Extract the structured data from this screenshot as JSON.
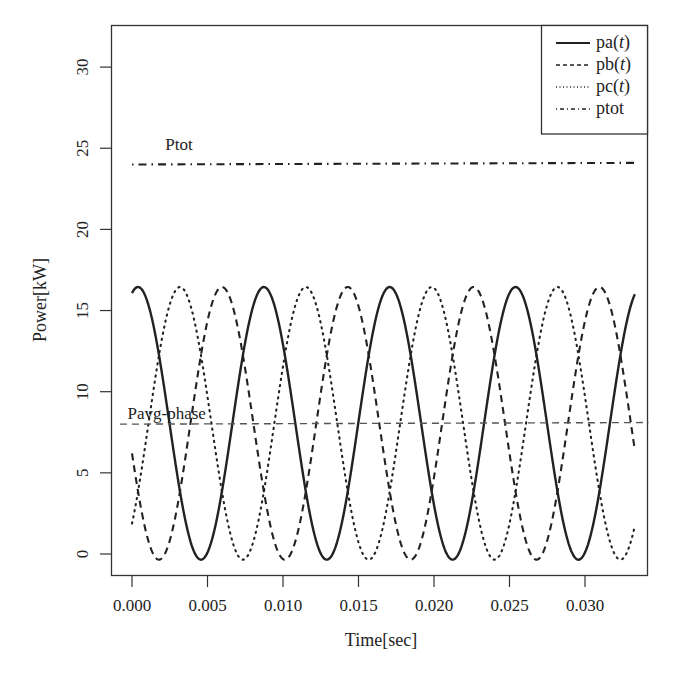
{
  "chart_data": {
    "type": "line",
    "title": "",
    "xlabel": "Time[sec]",
    "ylabel": "Power[kW]",
    "xlim": [
      -0.0013,
      0.0342
    ],
    "ylim": [
      -1.3,
      32.3
    ],
    "xticks": [
      0.0,
      0.005,
      0.01,
      0.015,
      0.02,
      0.025,
      0.03
    ],
    "xtick_labels": [
      "0.000",
      "0.005",
      "0.010",
      "0.015",
      "0.020",
      "0.025",
      "0.030"
    ],
    "yticks": [
      0,
      5,
      10,
      15,
      20,
      25,
      30
    ],
    "ytick_labels": [
      "0",
      "5",
      "10",
      "15",
      "20",
      "25",
      "30"
    ],
    "grid": false,
    "legend_position": "top-right",
    "legend": [
      {
        "label": "pa",
        "italic_arg": "t",
        "style": "solid"
      },
      {
        "label": "pb",
        "italic_arg": "t",
        "style": "dashed"
      },
      {
        "label": "pc",
        "italic_arg": "t",
        "style": "dotted"
      },
      {
        "label": "ptot",
        "italic_arg": "",
        "style": "dashdot"
      }
    ],
    "annotations": [
      {
        "text": "Ptot",
        "x": 0.0022,
        "y": 24.9
      },
      {
        "text": "Pavg-phase",
        "x": -0.0003,
        "y": 8.3
      }
    ],
    "model": {
      "description": "p_k(t) = Pavg + A*cos(2*pi*f*(t - t0 - k*T/3)), f = 120 Hz",
      "pavg": 8.05,
      "amplitude": 8.4,
      "frequency_hz": 120,
      "t0": 0.0004,
      "t_start": 0.0,
      "t_end": 0.0333
    },
    "series": [
      {
        "name": "pa(t)",
        "style": "solid",
        "x": [
          0.0,
          0.0004,
          0.0025,
          0.0046,
          0.0067,
          0.0088,
          0.0108,
          0.0129,
          0.015,
          0.0171,
          0.0192,
          0.0213,
          0.0233,
          0.0254,
          0.0275,
          0.0296,
          0.0317,
          0.0333
        ],
        "values": [
          16.1,
          16.4,
          8.0,
          -0.3,
          8.0,
          16.4,
          8.4,
          -0.3,
          7.7,
          16.4,
          8.4,
          -0.3,
          7.6,
          16.4,
          8.5,
          -0.3,
          7.6,
          16.2
        ]
      },
      {
        "name": "pb(t)",
        "style": "dashed",
        "x": [
          0.0,
          0.0018,
          0.0039,
          0.006,
          0.0081,
          0.0101,
          0.0122,
          0.0143,
          0.0164,
          0.0185,
          0.0206,
          0.0226,
          0.0247,
          0.0268,
          0.0289,
          0.031,
          0.0333
        ],
        "values": [
          6.5,
          -0.3,
          8.0,
          16.4,
          8.0,
          -0.3,
          8.0,
          16.4,
          8.0,
          -0.3,
          8.0,
          16.4,
          8.0,
          -0.3,
          8.0,
          16.4,
          6.6
        ]
      },
      {
        "name": "pc(t)",
        "style": "dotted",
        "x": [
          0.0,
          0.0011,
          0.0032,
          0.0053,
          0.0074,
          0.0094,
          0.0115,
          0.0136,
          0.0157,
          0.0178,
          0.0198,
          0.0219,
          0.024,
          0.0261,
          0.0282,
          0.0303,
          0.0324,
          0.0333
        ],
        "values": [
          1.5,
          8.0,
          16.4,
          8.0,
          -0.3,
          8.0,
          16.4,
          8.0,
          -0.3,
          8.0,
          16.4,
          8.0,
          -0.3,
          8.0,
          16.4,
          8.0,
          -0.3,
          1.3
        ]
      },
      {
        "name": "ptot",
        "style": "dashdot",
        "x": [
          0.0,
          0.0333
        ],
        "values": [
          24.0,
          24.1
        ]
      },
      {
        "name": "Pavg-phase",
        "style": "dashed",
        "x": [
          -0.0008,
          0.0342
        ],
        "values": [
          8.0,
          8.1
        ]
      }
    ]
  },
  "axes": {
    "x_title": "Time[sec]",
    "y_title": "Power[kW]"
  },
  "legend": {
    "items": [
      {
        "name": "pa",
        "arg": "t"
      },
      {
        "name": "pb",
        "arg": "t"
      },
      {
        "name": "pc",
        "arg": "t"
      },
      {
        "name": "ptot",
        "arg": ""
      }
    ]
  },
  "colors": {
    "line": "#222222",
    "axis": "#333333",
    "background": "#ffffff"
  }
}
